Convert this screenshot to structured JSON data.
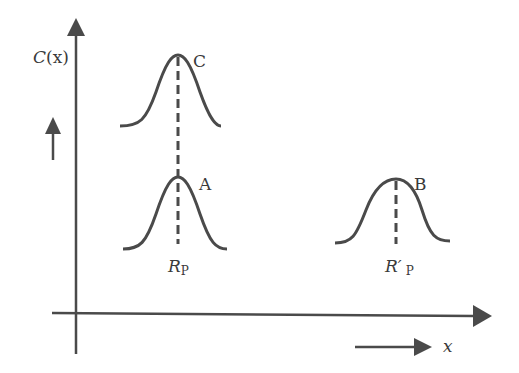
{
  "diagram": {
    "type": "concentration-profile",
    "colors": {
      "stroke": "#4a4a4a",
      "text": "#3a3a3a",
      "background": "#ffffff"
    },
    "y_axis": {
      "label": "C(x)",
      "label_main": "C",
      "label_arg": "(x)"
    },
    "x_axis": {
      "label": "x"
    },
    "direction_arrows": [
      {
        "id": "up-arrow",
        "direction": "up",
        "meaning": "increasing C"
      },
      {
        "id": "right-arrow",
        "direction": "right",
        "meaning": "increasing x"
      }
    ],
    "peaks": [
      {
        "id": "C",
        "label": "C",
        "position_label": "",
        "level": "high"
      },
      {
        "id": "A",
        "label": "A",
        "position_label_main": "R",
        "position_label_sub": "P",
        "level": "low"
      },
      {
        "id": "B",
        "label": "B",
        "position_label_main": "R′",
        "position_label_sub": "P",
        "level": "low"
      }
    ]
  }
}
